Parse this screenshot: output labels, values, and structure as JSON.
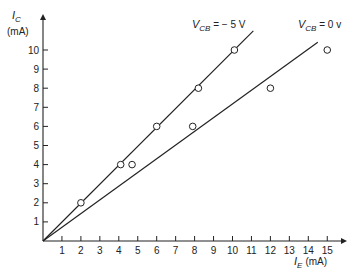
{
  "chart_data": {
    "type": "scatter",
    "title": "",
    "xlabel": "I_E (mA)",
    "ylabel": "I_C (mA)",
    "xlim": [
      0,
      15.5
    ],
    "ylim": [
      0,
      11
    ],
    "grid": false,
    "x_ticks": [
      1,
      2,
      3,
      4,
      5,
      6,
      7,
      8,
      9,
      10,
      11,
      12,
      13,
      14,
      15
    ],
    "y_ticks": [
      1,
      2,
      3,
      4,
      5,
      6,
      7,
      8,
      9,
      10
    ],
    "series": [
      {
        "name": "V_CB = − 5 V",
        "points": [
          [
            2,
            2
          ],
          [
            4.1,
            4
          ],
          [
            6,
            6
          ],
          [
            8.2,
            8
          ],
          [
            10.1,
            10
          ]
        ],
        "fit_line": [
          [
            0,
            0
          ],
          [
            11.1,
            11
          ]
        ]
      },
      {
        "name": "V_CB = 0 v",
        "points": [
          [
            4.7,
            4
          ],
          [
            7.9,
            6
          ],
          [
            12,
            8
          ],
          [
            15,
            10
          ]
        ],
        "fit_line": [
          [
            0,
            0
          ],
          [
            14.5,
            10.4
          ]
        ]
      }
    ],
    "annotations": [
      "V_CB = − 5 V",
      "V_CB = 0 v"
    ]
  },
  "axes": {
    "y_label_main": "I",
    "y_label_sub": "C",
    "y_label_unit": "(mA)",
    "x_label_main": "I",
    "x_label_sub": "E",
    "x_label_unit": "(mA)"
  },
  "labels": {
    "line1_main": "V",
    "line1_sub": "CB",
    "line1_rest": " =  − 5 V",
    "line2_main": "V",
    "line2_sub": "CB",
    "line2_rest": " = 0 v"
  }
}
